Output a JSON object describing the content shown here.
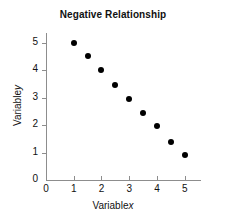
{
  "chart_data": {
    "type": "scatter",
    "title": "Negative Relationship",
    "xlabel": "Variable x",
    "xlabel_text": "Variable",
    "xlabel_symbol": "x",
    "ylabel": "Variable y",
    "ylabel_text": "Variable",
    "ylabel_symbol": "y",
    "xlim": [
      0,
      5.55
    ],
    "ylim": [
      0,
      5.35
    ],
    "grid": false,
    "legend": null,
    "marker_color": "#000000",
    "axis_color": "#8d8d8d",
    "background_color": "#ffffff",
    "xticks": [
      0,
      1,
      2,
      3,
      4,
      5
    ],
    "xtick_labels": [
      "0",
      "1",
      "2",
      "3",
      "4",
      "5"
    ],
    "yticks": [
      0,
      1,
      2,
      3,
      4,
      5
    ],
    "ytick_labels": [
      "0",
      "1",
      "2",
      "3",
      "4",
      "5"
    ],
    "x": [
      1,
      1.5,
      2,
      2.5,
      3,
      3.5,
      4,
      4.5,
      5
    ],
    "y": [
      5.0,
      4.5,
      4.0,
      3.45,
      2.95,
      2.45,
      1.95,
      1.4,
      0.9
    ],
    "points": [
      {
        "x": 1,
        "y": 5.0
      },
      {
        "x": 1.5,
        "y": 4.5
      },
      {
        "x": 2,
        "y": 4.0
      },
      {
        "x": 2.5,
        "y": 3.45
      },
      {
        "x": 3,
        "y": 2.95
      },
      {
        "x": 3.5,
        "y": 2.45
      },
      {
        "x": 4,
        "y": 1.95
      },
      {
        "x": 4.5,
        "y": 1.4
      },
      {
        "x": 5,
        "y": 0.9
      }
    ]
  }
}
